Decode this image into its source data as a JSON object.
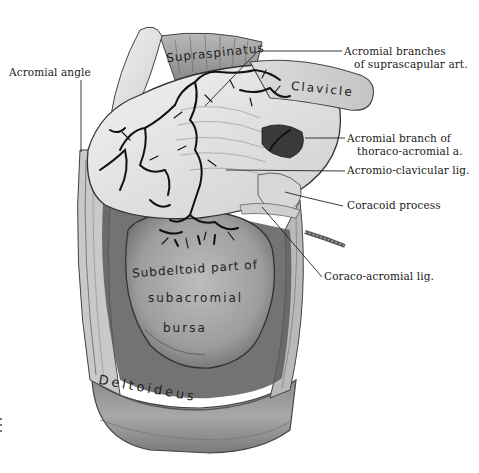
{
  "figure": {
    "labels": {
      "acromial_angle": "Acromial angle",
      "acromial_branches_line1": "Acromial branches",
      "acromial_branches_line2": "of suprascapular art.",
      "acromial_branch_thoraco_line1": "Acromial branch of",
      "acromial_branch_thoraco_line2": "thoraco-acromial a.",
      "acromio_clavicular": "Acromio-clavicular lig.",
      "coracoid_process": "Coracoid process",
      "coraco_acromial": "Coraco-acromial lig."
    },
    "in_figure_text": {
      "supraspinatus": "Supraspinatus",
      "clavicle": "Clavicle",
      "bursa_line1": "Subdeltoid part of",
      "bursa_line2": "subacromial",
      "bursa_line3": "bursa",
      "deltoideus": "Deltoideus"
    },
    "colors": {
      "background": "#ffffff",
      "ink": "#1a1a1a",
      "vessel": "#111111",
      "bone_light": "#e4e4e4",
      "muscle_mid": "#9a9a9a",
      "shadow": "#3a3a3a"
    }
  }
}
